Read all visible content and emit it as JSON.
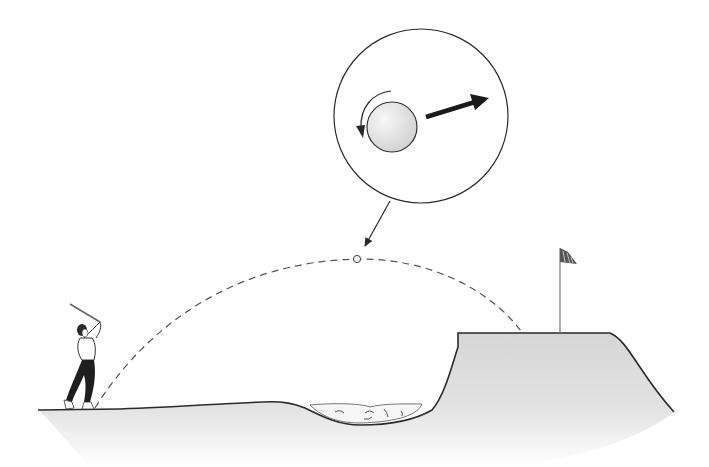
{
  "figure": {
    "elements": {
      "golfer": "golfer-follow-through",
      "trajectory": "dashed-flight-path",
      "ball": "golf-ball",
      "magnifier": "magnified-ball-inset",
      "spin_arrow": "backspin-arrow",
      "velocity_arrow": "velocity-arrow",
      "bunker": "sand-bunker",
      "green": "elevated-green",
      "flag": "flagstick"
    },
    "colors": {
      "ink": "#2a2a2a",
      "ground": "#d9d9d9",
      "sand": "#f4f4f4",
      "ball": "#e2e2e2"
    }
  }
}
